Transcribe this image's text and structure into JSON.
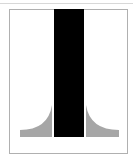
{
  "figure": {
    "colors": {
      "bar": "#000000",
      "flare": "#a6a6a6",
      "frame": "#b0b0b0",
      "background": "#ffffff"
    }
  }
}
